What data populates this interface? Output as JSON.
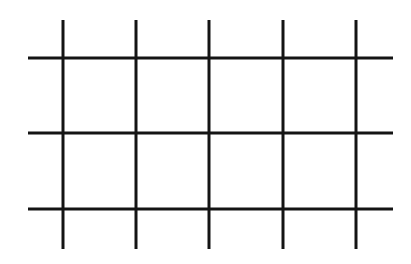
{
  "diagram": {
    "type": "grid-lines",
    "line_color": "#141414",
    "line_width": 3,
    "background": "#ffffff",
    "vertical_lines": [
      {
        "x": 63,
        "y1": 20,
        "y2": 249
      },
      {
        "x": 136,
        "y1": 20,
        "y2": 249
      },
      {
        "x": 209,
        "y1": 20,
        "y2": 249
      },
      {
        "x": 283,
        "y1": 20,
        "y2": 249
      },
      {
        "x": 356,
        "y1": 20,
        "y2": 249
      }
    ],
    "horizontal_lines": [
      {
        "y": 58,
        "x1": 28,
        "x2": 393
      },
      {
        "y": 133,
        "x1": 28,
        "x2": 393
      },
      {
        "y": 209,
        "x1": 28,
        "x2": 393
      }
    ]
  }
}
